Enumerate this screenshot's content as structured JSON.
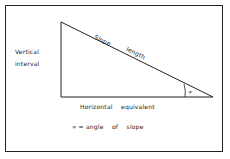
{
  "diagram": {
    "labels": {
      "vertical_interval_line1": "Vertical",
      "vertical_interval_line2": "interval",
      "slope": "Slope",
      "length": "length",
      "horizontal_equivalent": "Horizontal    equivalent",
      "angle_symbol": "∝",
      "legend": "∝ = angle    of    slope"
    },
    "colors": {
      "line": "#222222",
      "background": "#ffffff"
    }
  }
}
